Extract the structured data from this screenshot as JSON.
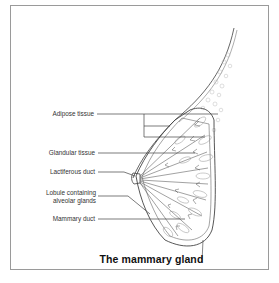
{
  "diagram": {
    "title": "The mammary gland",
    "labels": [
      {
        "id": "adipose",
        "text": "Adipose tissue"
      },
      {
        "id": "glandular",
        "text": "Glandular tissue"
      },
      {
        "id": "lactiferous",
        "text": "Lactiferous duct"
      },
      {
        "id": "lobule",
        "line1": "Lobule containing",
        "line2": "alveolar glands"
      },
      {
        "id": "mammary",
        "text": "Mammary duct"
      }
    ],
    "colors": {
      "line": "#444444",
      "frame": "#9a9a9a",
      "fat": "#bdbdbd"
    }
  }
}
